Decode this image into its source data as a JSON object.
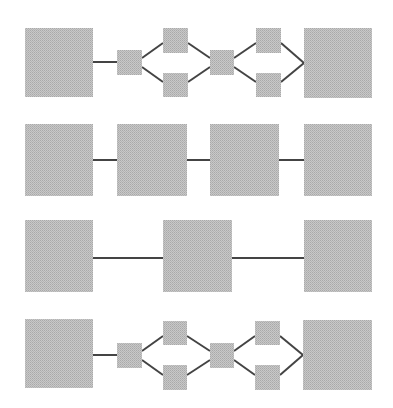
{
  "diagram": {
    "title": "",
    "colors": {
      "node_fill": "#c4c4c4",
      "node_dither": "#a8a8a8",
      "edge": "#444444",
      "background": "#ffffff"
    },
    "rows": [
      {
        "id": "row-1",
        "description": "large node -> small node -> two parallel small nodes -> small node -> two parallel small nodes -> large node",
        "nodes": [
          {
            "id": "r1-n1",
            "size": "large",
            "x": 25,
            "y": 28,
            "w": 68,
            "h": 69
          },
          {
            "id": "r1-n2",
            "size": "small",
            "x": 117,
            "y": 50,
            "w": 25,
            "h": 25
          },
          {
            "id": "r1-n3",
            "size": "small",
            "x": 163,
            "y": 28,
            "w": 25,
            "h": 25
          },
          {
            "id": "r1-n4",
            "size": "small",
            "x": 163,
            "y": 73,
            "w": 25,
            "h": 24
          },
          {
            "id": "r1-n5",
            "size": "small",
            "x": 210,
            "y": 50,
            "w": 24,
            "h": 25
          },
          {
            "id": "r1-n6",
            "size": "small",
            "x": 256,
            "y": 28,
            "w": 25,
            "h": 25
          },
          {
            "id": "r1-n7",
            "size": "small",
            "x": 256,
            "y": 73,
            "w": 25,
            "h": 24
          },
          {
            "id": "r1-n8",
            "size": "large",
            "x": 304,
            "y": 28,
            "w": 68,
            "h": 70
          }
        ],
        "edges": [
          {
            "from": "r1-n1",
            "to": "r1-n2",
            "x1": 93,
            "y1": 62,
            "x2": 117,
            "y2": 62
          },
          {
            "from": "r1-n2",
            "to": "r1-n3",
            "x1": 142,
            "y1": 58,
            "x2": 163,
            "y2": 43
          },
          {
            "from": "r1-n2",
            "to": "r1-n4",
            "x1": 142,
            "y1": 67,
            "x2": 163,
            "y2": 82
          },
          {
            "from": "r1-n3",
            "to": "r1-n5",
            "x1": 188,
            "y1": 43,
            "x2": 210,
            "y2": 58
          },
          {
            "from": "r1-n4",
            "to": "r1-n5",
            "x1": 188,
            "y1": 82,
            "x2": 210,
            "y2": 67
          },
          {
            "from": "r1-n5",
            "to": "r1-n6",
            "x1": 234,
            "y1": 58,
            "x2": 256,
            "y2": 43
          },
          {
            "from": "r1-n5",
            "to": "r1-n7",
            "x1": 234,
            "y1": 67,
            "x2": 256,
            "y2": 82
          },
          {
            "from": "r1-n6",
            "to": "r1-n8",
            "x1": 281,
            "y1": 43,
            "x2": 304,
            "y2": 63
          },
          {
            "from": "r1-n7",
            "to": "r1-n8",
            "x1": 281,
            "y1": 82,
            "x2": 304,
            "y2": 63
          }
        ]
      },
      {
        "id": "row-2",
        "description": "four large nodes in a chain",
        "nodes": [
          {
            "id": "r2-n1",
            "size": "large",
            "x": 25,
            "y": 124,
            "w": 68,
            "h": 72
          },
          {
            "id": "r2-n2",
            "size": "large",
            "x": 117,
            "y": 124,
            "w": 70,
            "h": 72
          },
          {
            "id": "r2-n3",
            "size": "large",
            "x": 210,
            "y": 124,
            "w": 69,
            "h": 72
          },
          {
            "id": "r2-n4",
            "size": "large",
            "x": 304,
            "y": 124,
            "w": 68,
            "h": 72
          }
        ],
        "edges": [
          {
            "from": "r2-n1",
            "to": "r2-n2",
            "x1": 93,
            "y1": 160,
            "x2": 117,
            "y2": 160
          },
          {
            "from": "r2-n2",
            "to": "r2-n3",
            "x1": 187,
            "y1": 160,
            "x2": 210,
            "y2": 160
          },
          {
            "from": "r2-n3",
            "to": "r2-n4",
            "x1": 279,
            "y1": 160,
            "x2": 304,
            "y2": 160
          }
        ]
      },
      {
        "id": "row-3",
        "description": "three large nodes in a chain",
        "nodes": [
          {
            "id": "r3-n1",
            "size": "large",
            "x": 25,
            "y": 220,
            "w": 68,
            "h": 72
          },
          {
            "id": "r3-n2",
            "size": "large",
            "x": 163,
            "y": 220,
            "w": 69,
            "h": 72
          },
          {
            "id": "r3-n3",
            "size": "large",
            "x": 304,
            "y": 220,
            "w": 68,
            "h": 72
          }
        ],
        "edges": [
          {
            "from": "r3-n1",
            "to": "r3-n2",
            "x1": 93,
            "y1": 258,
            "x2": 163,
            "y2": 258
          },
          {
            "from": "r3-n2",
            "to": "r3-n3",
            "x1": 232,
            "y1": 258,
            "x2": 304,
            "y2": 258
          }
        ]
      },
      {
        "id": "row-4",
        "description": "large node -> small node -> two parallel small nodes -> small node -> two parallel small nodes -> large node",
        "nodes": [
          {
            "id": "r4-n1",
            "size": "large",
            "x": 25,
            "y": 319,
            "w": 68,
            "h": 69
          },
          {
            "id": "r4-n2",
            "size": "small",
            "x": 117,
            "y": 343,
            "w": 25,
            "h": 25
          },
          {
            "id": "r4-n3",
            "size": "small",
            "x": 163,
            "y": 321,
            "w": 24,
            "h": 24
          },
          {
            "id": "r4-n4",
            "size": "small",
            "x": 163,
            "y": 365,
            "w": 24,
            "h": 25
          },
          {
            "id": "r4-n5",
            "size": "small",
            "x": 210,
            "y": 343,
            "w": 24,
            "h": 25
          },
          {
            "id": "r4-n6",
            "size": "small",
            "x": 255,
            "y": 321,
            "w": 25,
            "h": 24
          },
          {
            "id": "r4-n7",
            "size": "small",
            "x": 255,
            "y": 365,
            "w": 25,
            "h": 25
          },
          {
            "id": "r4-n8",
            "size": "large",
            "x": 303,
            "y": 320,
            "w": 69,
            "h": 70
          }
        ],
        "edges": [
          {
            "from": "r4-n1",
            "to": "r4-n2",
            "x1": 93,
            "y1": 355,
            "x2": 117,
            "y2": 355
          },
          {
            "from": "r4-n2",
            "to": "r4-n3",
            "x1": 142,
            "y1": 351,
            "x2": 163,
            "y2": 336
          },
          {
            "from": "r4-n2",
            "to": "r4-n4",
            "x1": 142,
            "y1": 360,
            "x2": 163,
            "y2": 375
          },
          {
            "from": "r4-n3",
            "to": "r4-n5",
            "x1": 187,
            "y1": 336,
            "x2": 210,
            "y2": 351
          },
          {
            "from": "r4-n4",
            "to": "r4-n5",
            "x1": 187,
            "y1": 375,
            "x2": 210,
            "y2": 360
          },
          {
            "from": "r4-n5",
            "to": "r4-n6",
            "x1": 234,
            "y1": 351,
            "x2": 255,
            "y2": 336
          },
          {
            "from": "r4-n5",
            "to": "r4-n7",
            "x1": 234,
            "y1": 360,
            "x2": 255,
            "y2": 375
          },
          {
            "from": "r4-n6",
            "to": "r4-n8",
            "x1": 280,
            "y1": 336,
            "x2": 303,
            "y2": 355
          },
          {
            "from": "r4-n7",
            "to": "r4-n8",
            "x1": 280,
            "y1": 375,
            "x2": 303,
            "y2": 355
          }
        ]
      }
    ]
  }
}
